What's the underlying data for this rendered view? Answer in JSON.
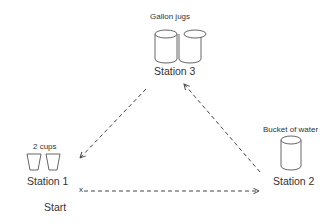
{
  "diagram": {
    "stations": [
      {
        "id": "station-3",
        "name": "Station 3",
        "item_label": "Gallon jugs",
        "icon": "jug-icon"
      },
      {
        "id": "station-1",
        "name": "Station 1",
        "item_label": "2 cups",
        "icon": "cup-icon"
      },
      {
        "id": "station-2",
        "name": "Station 2",
        "item_label": "Bucket of water",
        "icon": "bucket-icon"
      }
    ],
    "start": {
      "marker": "x",
      "label": "Start"
    },
    "arrows": [
      {
        "from": "Start",
        "to": "Station 2",
        "style": "dashed"
      },
      {
        "from": "Station 2",
        "to": "Station 3",
        "style": "dashed"
      },
      {
        "from": "Station 3",
        "to": "Station 1",
        "style": "dashed"
      }
    ]
  }
}
